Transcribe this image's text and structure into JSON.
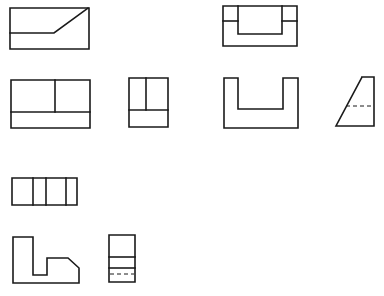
{
  "diagram": {
    "type": "orthographic-projection-views",
    "stroke_color": "#1a1a1a",
    "background": "#ffffff",
    "views": [
      {
        "id": "view-1-slanted-rect",
        "polylines": [
          [
            [
              10,
              8
            ],
            [
              89,
              8
            ],
            [
              89,
              49
            ],
            [
              10,
              49
            ],
            [
              10,
              8
            ]
          ],
          [
            [
              10,
              33
            ],
            [
              54,
              33
            ],
            [
              88,
              8
            ]
          ]
        ],
        "dashed": []
      },
      {
        "id": "view-2-notched-top",
        "polylines": [
          [
            [
              223,
              6
            ],
            [
              297,
              6
            ],
            [
              297,
              46
            ],
            [
              223,
              46
            ],
            [
              223,
              6
            ]
          ],
          [
            [
              238,
              6
            ],
            [
              238,
              34
            ],
            [
              282,
              34
            ],
            [
              282,
              6
            ]
          ],
          [
            [
              223,
              21
            ],
            [
              238,
              21
            ]
          ],
          [
            [
              282,
              21
            ],
            [
              297,
              21
            ]
          ]
        ],
        "dashed": []
      },
      {
        "id": "view-3-front-rect",
        "polylines": [
          [
            [
              11,
              80
            ],
            [
              90,
              80
            ],
            [
              90,
              128
            ],
            [
              11,
              128
            ],
            [
              11,
              80
            ]
          ],
          [
            [
              11,
              112
            ],
            [
              90,
              112
            ]
          ],
          [
            [
              55,
              80
            ],
            [
              55,
              112
            ]
          ]
        ],
        "dashed": []
      },
      {
        "id": "view-4-side-rect",
        "polylines": [
          [
            [
              129,
              78
            ],
            [
              168,
              78
            ],
            [
              168,
              127
            ],
            [
              129,
              127
            ],
            [
              129,
              78
            ]
          ],
          [
            [
              129,
              110
            ],
            [
              168,
              110
            ]
          ],
          [
            [
              146,
              78
            ],
            [
              146,
              110
            ]
          ]
        ],
        "dashed": []
      },
      {
        "id": "view-5-u-channel",
        "polylines": [
          [
            [
              224,
              78
            ],
            [
              238,
              78
            ],
            [
              238,
              109
            ],
            [
              283,
              109
            ],
            [
              283,
              78
            ],
            [
              298,
              78
            ],
            [
              298,
              128
            ],
            [
              224,
              128
            ],
            [
              224,
              78
            ]
          ]
        ],
        "dashed": []
      },
      {
        "id": "view-6-trapezoid",
        "polylines": [
          [
            [
              362,
              77
            ],
            [
              374,
              77
            ],
            [
              374,
              126
            ],
            [
              336,
              126
            ],
            [
              362,
              77
            ]
          ]
        ],
        "dashed": [
          [
            [
              346,
              106
            ],
            [
              374,
              106
            ]
          ]
        ]
      },
      {
        "id": "view-7-segmented-rect",
        "polylines": [
          [
            [
              12,
              178
            ],
            [
              77,
              178
            ],
            [
              77,
              205
            ],
            [
              12,
              205
            ],
            [
              12,
              178
            ]
          ],
          [
            [
              33,
              178
            ],
            [
              33,
              205
            ]
          ],
          [
            [
              46,
              178
            ],
            [
              46,
              205
            ]
          ],
          [
            [
              66,
              178
            ],
            [
              66,
              205
            ]
          ]
        ],
        "dashed": []
      },
      {
        "id": "view-8-l-profile",
        "polylines": [
          [
            [
              13,
              237
            ],
            [
              33,
              237
            ],
            [
              33,
              275
            ],
            [
              47,
              275
            ],
            [
              47,
              258
            ],
            [
              68,
              258
            ],
            [
              79,
              268
            ],
            [
              79,
              283
            ],
            [
              13,
              283
            ],
            [
              13,
              237
            ]
          ]
        ],
        "dashed": []
      },
      {
        "id": "view-9-tall-rect",
        "polylines": [
          [
            [
              109,
              235
            ],
            [
              135,
              235
            ],
            [
              135,
              282
            ],
            [
              109,
              282
            ],
            [
              109,
              235
            ]
          ],
          [
            [
              109,
              257
            ],
            [
              135,
              257
            ]
          ],
          [
            [
              109,
              268
            ],
            [
              135,
              268
            ]
          ]
        ],
        "dashed": [
          [
            [
              110,
              274
            ],
            [
              134,
              274
            ]
          ]
        ]
      }
    ]
  }
}
